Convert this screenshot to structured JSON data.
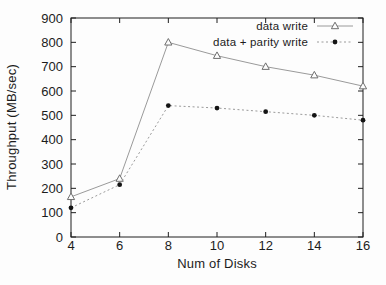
{
  "figure": {
    "background_color": "#fdfdfd",
    "frame_color": "#1f1f1f",
    "text_color": "#1c1c1c"
  },
  "chart_data": {
    "type": "line",
    "title": "",
    "xlabel": "Num of Disks",
    "ylabel": "Throughput (MB/sec)",
    "x": [
      4,
      6,
      8,
      10,
      12,
      14,
      16
    ],
    "xlim": [
      4,
      16
    ],
    "ylim": [
      0,
      900
    ],
    "x_ticks": [
      4,
      6,
      8,
      10,
      12,
      14,
      16
    ],
    "y_ticks": [
      0,
      100,
      200,
      300,
      400,
      500,
      600,
      700,
      800,
      900
    ],
    "grid": false,
    "legend_position": "top-right-inside",
    "series": [
      {
        "name": "data write",
        "marker": "triangle-open",
        "line_style": "solid",
        "line_color": "#9a9a9a",
        "marker_color": "#6e6e6e",
        "values": [
          165,
          240,
          800,
          745,
          700,
          665,
          620
        ]
      },
      {
        "name": "data + parity write",
        "marker": "circle-filled",
        "line_style": "dotted",
        "line_color": "#9a9a9a",
        "marker_color": "#141414",
        "values": [
          120,
          215,
          540,
          530,
          515,
          500,
          480
        ]
      }
    ]
  }
}
